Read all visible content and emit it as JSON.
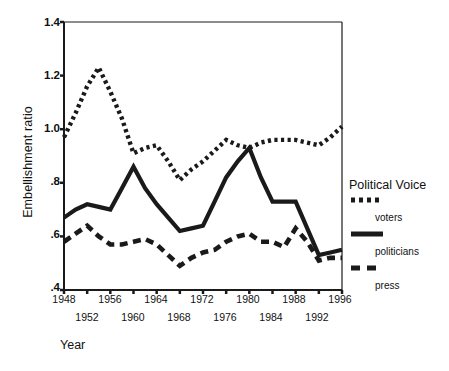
{
  "chart_data": {
    "type": "line",
    "title": "",
    "xlabel": "Year",
    "ylabel": "Embellishment ratio",
    "xlim": [
      1948,
      1996
    ],
    "ylim": [
      0.4,
      1.4
    ],
    "grid": false,
    "legend_position": "right",
    "legend_title": "Political Voice",
    "x": [
      1948,
      1950,
      1952,
      1954,
      1956,
      1958,
      1960,
      1962,
      1964,
      1966,
      1968,
      1970,
      1972,
      1974,
      1976,
      1978,
      1980,
      1982,
      1984,
      1986,
      1988,
      1990,
      1992,
      1994,
      1996
    ],
    "series": [
      {
        "name": "voters",
        "style": "dotted",
        "values": [
          0.97,
          1.06,
          1.16,
          1.23,
          1.14,
          1.04,
          0.91,
          0.93,
          0.94,
          0.88,
          0.81,
          0.85,
          0.88,
          0.92,
          0.96,
          0.94,
          0.93,
          0.95,
          0.96,
          0.96,
          0.96,
          0.95,
          0.94,
          0.97,
          1.01
        ]
      },
      {
        "name": "politicians",
        "style": "solid",
        "values": [
          0.67,
          0.7,
          0.72,
          0.71,
          0.7,
          0.78,
          0.86,
          0.78,
          0.72,
          0.67,
          0.62,
          0.63,
          0.64,
          0.73,
          0.82,
          0.88,
          0.93,
          0.82,
          0.73,
          0.73,
          0.73,
          0.63,
          0.53,
          0.54,
          0.55
        ]
      },
      {
        "name": "press",
        "style": "dashed",
        "values": [
          0.58,
          0.61,
          0.64,
          0.6,
          0.57,
          0.57,
          0.58,
          0.59,
          0.57,
          0.53,
          0.49,
          0.52,
          0.54,
          0.55,
          0.58,
          0.6,
          0.61,
          0.58,
          0.58,
          0.56,
          0.63,
          0.58,
          0.51,
          0.52,
          0.52
        ]
      }
    ],
    "yticks": [
      0.4,
      0.6,
      0.8,
      1.0,
      1.2,
      1.4
    ],
    "ytick_labels": [
      ".4",
      ".6",
      ".8",
      "1.0",
      "1.2",
      "1.4"
    ],
    "xticks_upper": [
      1948,
      1956,
      1964,
      1972,
      1980,
      1988,
      1996
    ],
    "xticks_lower": [
      1952,
      1960,
      1968,
      1976,
      1984,
      1992
    ],
    "colors": {
      "line": "#1a1a1a",
      "axis": "#1a1a1a",
      "background": "#ffffff"
    }
  }
}
